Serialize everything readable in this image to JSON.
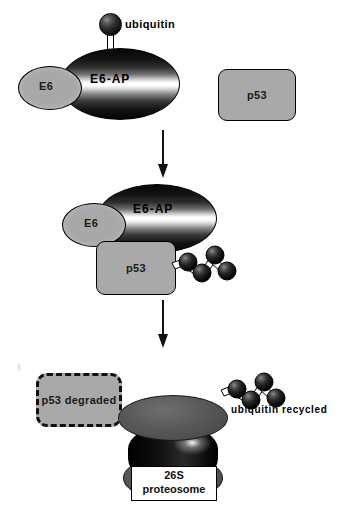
{
  "diagram": {
    "background_color": "#ffffff",
    "ink_color": "#000000",
    "protein_fill_color": "#a9a9a9"
  },
  "panels": {
    "top": {
      "name": "binding-stage",
      "ubiquitin_label": "ubiquitin",
      "e6ap_label": "E6-AP",
      "e6_label": "E6",
      "p53_label": "p53"
    },
    "middle": {
      "name": "ubiquitination-stage",
      "e6ap_label": "E6-AP",
      "e6_label": "E6",
      "p53_label": "p53",
      "ubiquitin_chain_units": 4
    },
    "bottom": {
      "name": "degradation-stage",
      "p53_degraded_label_line1": "p53",
      "p53_degraded_label_line2": "degraded",
      "ubiquitin_recycled_label": "ubiquitin recycled",
      "proteasome_label_line1": "26S",
      "proteasome_label_line2": "proteosome",
      "recycled_chain_units": 4
    }
  },
  "arrows": [
    {
      "name": "arrow-top-to-middle",
      "direction": "down"
    },
    {
      "name": "arrow-middle-to-bottom",
      "direction": "down"
    }
  ],
  "artifact": {
    "mark": "§"
  }
}
